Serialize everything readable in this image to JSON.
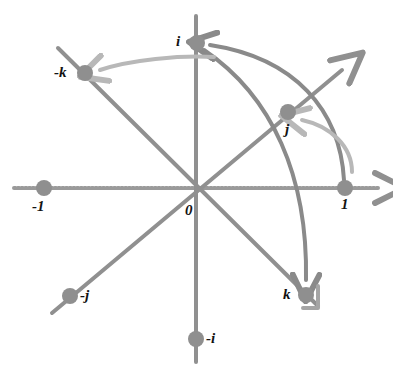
{
  "figure": {
    "background": "#ffffff",
    "width": 393,
    "height": 370
  },
  "colors": {
    "axis": "#909090",
    "axis_dotted": "#9a9a9a",
    "node": "#8f8f8f",
    "arc_dark": "#8a8a8a",
    "arc_light": "#b8b8b8",
    "label": "#121212"
  },
  "origin": {
    "x": 196,
    "y": 188,
    "label": "0",
    "label_x": 185,
    "label_y": 203
  },
  "nodes": [
    {
      "name": "i",
      "label": "i",
      "x": 197,
      "y": 43,
      "label_x": 176,
      "label_y": 34
    },
    {
      "name": "-i",
      "label": "-i",
      "x": 196,
      "y": 339,
      "label_x": 206,
      "label_y": 331
    },
    {
      "name": "j",
      "label": "j",
      "x": 288,
      "y": 112,
      "label_x": 285,
      "label_y": 122
    },
    {
      "name": "-j",
      "label": "-j",
      "x": 70,
      "y": 296,
      "label_x": 80,
      "label_y": 288
    },
    {
      "name": "k",
      "label": "k",
      "x": 306,
      "y": 295,
      "label_x": 283,
      "label_y": 287
    },
    {
      "name": "-k",
      "label": "-k",
      "x": 85,
      "y": 73,
      "label_x": 54,
      "label_y": 65
    },
    {
      "name": "1",
      "label": "1",
      "x": 345,
      "y": 188,
      "label_x": 341,
      "label_y": 197
    },
    {
      "name": "-1",
      "label": "-1",
      "x": 44,
      "y": 188,
      "label_x": 32,
      "label_y": 199
    }
  ],
  "axes": [
    {
      "name": "real-axis",
      "from": "-1",
      "to": "1",
      "style": "dotted",
      "arrow_end": true
    },
    {
      "name": "i-axis",
      "from": "-i",
      "to": "i",
      "style": "solid",
      "arrow_end": false
    },
    {
      "name": "j-axis",
      "from": "-j",
      "to": "j",
      "style": "solid",
      "arrow_end": true
    },
    {
      "name": "k-axis",
      "from": "-k",
      "to": "k",
      "style": "solid",
      "arrow_end": false
    }
  ],
  "arcs": [
    {
      "name": "arc-one-to-i",
      "from": "1",
      "to": "i",
      "tone": "dark",
      "description": "multiplication by i carries 1 to i"
    },
    {
      "name": "arc-i-to-k",
      "from": "i",
      "to": "k",
      "tone": "dark",
      "description": "multiplication by i carries i to k"
    },
    {
      "name": "arc-one-to-j",
      "from": "1",
      "to": "j",
      "tone": "light",
      "description": "rotation taking 1 to j"
    },
    {
      "name": "arc-i-to-mk",
      "from": "i",
      "to": "-k",
      "tone": "light",
      "description": "rotation taking i to -k"
    }
  ],
  "markers": {
    "corner_bracket": {
      "name": "k-corner-bracket",
      "x": 312,
      "y": 296
    }
  }
}
